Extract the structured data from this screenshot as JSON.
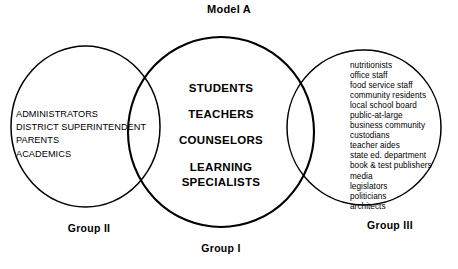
{
  "diagram": {
    "title": "Model A",
    "type": "venn-three-circle",
    "background_color": "#ffffff",
    "stroke_color": "#000000"
  },
  "groups": {
    "center": {
      "caption": "Group I",
      "items": [
        "STUDENTS",
        "TEACHERS",
        "COUNSELORS",
        "LEARNING SPECIALISTS"
      ],
      "items_display": [
        {
          "text": "STUDENTS",
          "multiline": false
        },
        {
          "text": "TEACHERS",
          "multiline": false
        },
        {
          "text": "COUNSELORS",
          "multiline": false
        },
        {
          "line1": "LEARNING",
          "line2": "SPECIALISTS",
          "multiline": true
        }
      ]
    },
    "left": {
      "caption": "Group II",
      "items": [
        "ADMINISTRATORS",
        "DISTRICT SUPERINTENDENT",
        "PARENTS",
        "ACADEMICS"
      ]
    },
    "right": {
      "caption": "Group III",
      "items": [
        "nutritionists",
        "office staff",
        "food service staff",
        "community residents",
        "local school board",
        "public-at-large",
        "business community",
        "custodians",
        "teacher aides",
        "state ed. department",
        "book & test publishers",
        "media",
        "legislators",
        "politicians",
        "architects"
      ]
    }
  }
}
